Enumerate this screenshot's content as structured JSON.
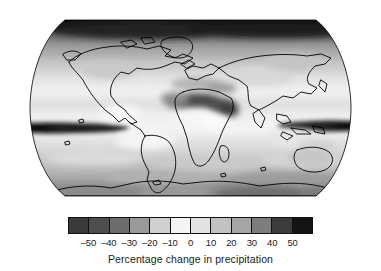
{
  "figure": {
    "background": "#ffffff",
    "caption": "Percentage change in precipitation"
  },
  "chart_data": {
    "type": "heatmap",
    "title": "",
    "subtitle": "",
    "xlabel": "",
    "ylabel": "",
    "colorbar_label": "Percentage change in precipitation",
    "projection": "Robinson",
    "grid": false,
    "legend_position": "bottom",
    "units": "percent",
    "variable": "Percentage change in precipitation",
    "domain": "global",
    "colormap": {
      "name": "diverging-grayscale",
      "description": "Dark at both extremes, near-white at zero",
      "discrete_levels": 12,
      "vmin": -60,
      "vmax": 60,
      "level_edges": [
        -60,
        -50,
        -40,
        -30,
        -20,
        -10,
        0,
        10,
        20,
        30,
        40,
        50,
        60
      ],
      "swatches": [
        "#3a3a3a",
        "#4e4e4e",
        "#6d6d6d",
        "#9a9a9a",
        "#cfcfcf",
        "#f4f4f4",
        "#e2e2e2",
        "#c2c2c2",
        "#a6a6a6",
        "#7d7d7d",
        "#3c3c3c",
        "#141414"
      ]
    },
    "colorbar_ticks": [
      {
        "value": -50,
        "label": "–50"
      },
      {
        "value": -40,
        "label": "–40"
      },
      {
        "value": -30,
        "label": "–30"
      },
      {
        "value": -20,
        "label": "–20"
      },
      {
        "value": -10,
        "label": "–10"
      },
      {
        "value": 0,
        "label": "0"
      },
      {
        "value": 10,
        "label": "10"
      },
      {
        "value": 20,
        "label": "20"
      },
      {
        "value": 30,
        "label": "30"
      },
      {
        "value": 40,
        "label": "40"
      },
      {
        "value": 50,
        "label": "50"
      }
    ],
    "regions": [
      {
        "name": "Arctic / high northern latitudes",
        "approx_value": 55,
        "shading": "very dark (strong increase)"
      },
      {
        "name": "Northern Eurasia and Canada",
        "approx_value": 18,
        "shading": "medium grey (increase)"
      },
      {
        "name": "Eastern Pacific ITCZ band",
        "approx_value": 58,
        "shading": "near black (large increase)"
      },
      {
        "name": "Western Pacific ITCZ band",
        "approx_value": 58,
        "shading": "near black (large increase)"
      },
      {
        "name": "Sahara, Sahel and Arabian Peninsula",
        "approx_value": -38,
        "shading": "dark (decrease)"
      },
      {
        "name": "Mediterranean and southern Europe",
        "approx_value": -15,
        "shading": "mid grey (decrease)"
      },
      {
        "name": "Subtropical oceans",
        "approx_value": -8,
        "shading": "light grey (slight decrease)"
      },
      {
        "name": "Equatorial Africa",
        "approx_value": 8,
        "shading": "light (slight increase)"
      },
      {
        "name": "Amazon and tropical South America",
        "approx_value": -5,
        "shading": "near white"
      },
      {
        "name": "Southern Ocean mid-latitudes",
        "approx_value": 15,
        "shading": "banded light to medium grey"
      },
      {
        "name": "Antarctica",
        "approx_value": 28,
        "shading": "medium grey (increase)"
      },
      {
        "name": "Australia",
        "approx_value": -10,
        "shading": "light grey (slight decrease)"
      }
    ]
  }
}
